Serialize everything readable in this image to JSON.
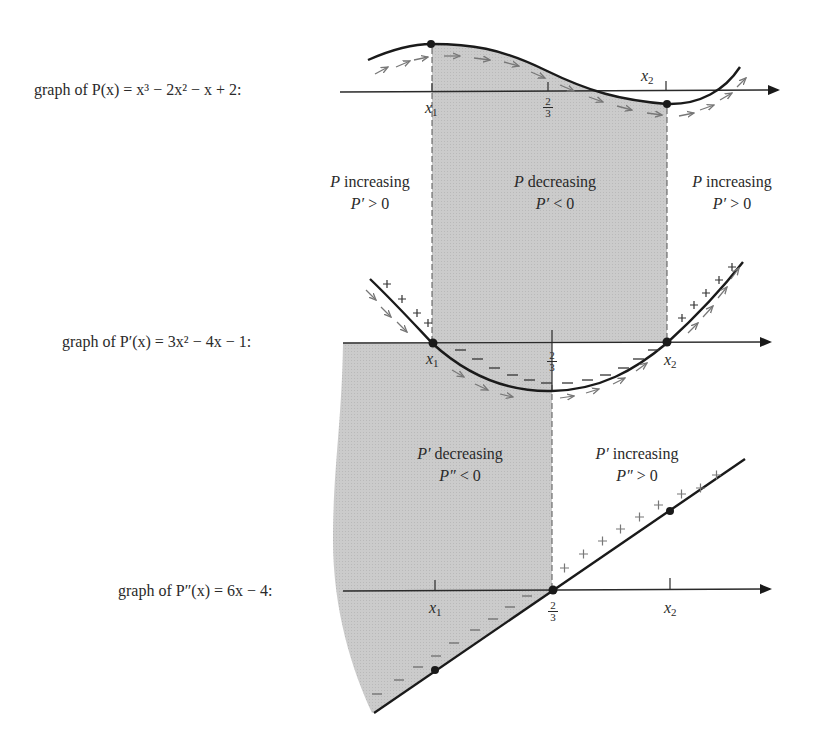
{
  "graphs": {
    "p": {
      "label_prefix": "graph of ",
      "fn": "P",
      "prime": "",
      "rhs_parts": [
        "x",
        "3",
        " − 2",
        "x",
        "2",
        " − ",
        "x",
        " + 2:"
      ],
      "label_full": "graph of P(x) = x³ − 2x² − x + 2:"
    },
    "p1": {
      "label_full": "graph of P′(x) = 3x² − 4x − 1:"
    },
    "p2": {
      "label_full": "graph of P″(x) = 6x − 4:"
    }
  },
  "ticks": {
    "x1": "x",
    "x1_sub": "1",
    "x2": "x",
    "x2_sub": "2",
    "two_thirds_num": "2",
    "two_thirds_den": "3"
  },
  "regions": {
    "p_left": {
      "line1_var": "P",
      "line1": " increasing",
      "line2_var": "P′",
      "line2": " > 0"
    },
    "p_mid": {
      "line1_var": "P",
      "line1": " decreasing",
      "line2_var": "P′",
      "line2": " < 0"
    },
    "p_right": {
      "line1_var": "P",
      "line1": " increasing",
      "line2_var": "P′",
      "line2": " > 0"
    },
    "p1_left": {
      "line1_var": "P′",
      "line1": " decreasing",
      "line2_var": "P″",
      "line2": " < 0"
    },
    "p1_right": {
      "line1_var": "P′",
      "line1": " increasing",
      "line2_var": "P″",
      "line2": " > 0"
    }
  },
  "signs": {
    "plus": "+",
    "minus": "−"
  },
  "colors": {
    "shade": "#c8c8c8",
    "curve": "#1a1a1a",
    "arrow": "#777777",
    "axis": "#2a2a2a"
  }
}
